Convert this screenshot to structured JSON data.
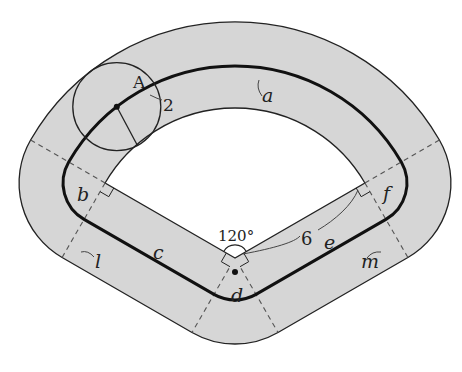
{
  "figure": {
    "colors": {
      "band_fill": "#d6d6d6",
      "line": "#222222",
      "background": "#ffffff"
    },
    "point_label": "A",
    "circle_radius_label": "2",
    "angle_label": "120°",
    "inner_radius_label": "6",
    "segment_labels": {
      "a": "a",
      "b": "b",
      "c": "c",
      "d": "d",
      "e": "e",
      "f": "f",
      "l": "l",
      "m": "m"
    }
  }
}
